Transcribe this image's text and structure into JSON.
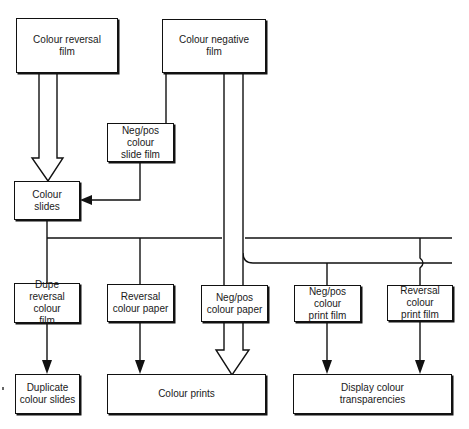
{
  "diagram": {
    "nodes": {
      "colour_reversal_film": "Colour reversal\nfilm",
      "colour_negative_film": "Colour negative\nfilm",
      "negpos_slide_film": "Neg/pos colour\nslide film",
      "colour_slides": "Colour\nslides",
      "dupe_reversal_film": "Dupe\nreversal colour\nfilm",
      "reversal_colour_paper": "Reversal\ncolour paper",
      "negpos_colour_paper": "Neg/pos\ncolour paper",
      "negpos_print_film": "Neg/pos colour\nprint film",
      "reversal_print_film": "Reversal\ncolour\nprint film",
      "duplicate_slides": "Duplicate\ncolour slides",
      "colour_prints": "Colour prints",
      "display_transparencies": "Display colour\ntransparencies"
    },
    "edges": [
      {
        "from": "Colour reversal film",
        "to": "Colour slides",
        "style": "hollow-arrow"
      },
      {
        "from": "Colour negative film",
        "to": "Neg/pos colour slide film",
        "style": "line"
      },
      {
        "from": "Neg/pos colour slide film",
        "to": "Colour slides",
        "style": "arrow"
      },
      {
        "from": "Colour negative film",
        "to": "Colour prints",
        "style": "hollow-arrow"
      },
      {
        "from": "Colour slides",
        "to": "Dupe reversal colour film",
        "style": "line"
      },
      {
        "from": "Colour slides",
        "to": "Reversal colour paper",
        "style": "line"
      },
      {
        "from": "Colour slides",
        "to": "Reversal colour print film",
        "style": "line"
      },
      {
        "from": "Colour negative film",
        "to": "Neg/pos colour print film",
        "style": "line"
      },
      {
        "from": "Dupe reversal colour film",
        "to": "Duplicate colour slides",
        "style": "arrow"
      },
      {
        "from": "Reversal colour paper",
        "to": "Colour prints",
        "style": "arrow"
      },
      {
        "from": "Neg/pos colour paper",
        "to": "Colour prints",
        "style": "hollow-arrow"
      },
      {
        "from": "Neg/pos colour print film",
        "to": "Display colour transparencies",
        "style": "arrow"
      },
      {
        "from": "Reversal colour print film",
        "to": "Display colour transparencies",
        "style": "arrow"
      }
    ],
    "colors": {
      "line": "#111111",
      "background": "#ffffff"
    }
  }
}
